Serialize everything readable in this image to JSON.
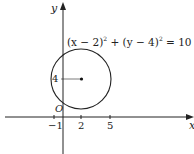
{
  "diagram": {
    "type": "coordinate-geometry-circle",
    "axes": {
      "x_label": "x",
      "y_label": "y",
      "origin_label": "O"
    },
    "equation": "(x − 2)² + (y − 4)² = 10",
    "equation_parts": {
      "a": "(x − 2)",
      "b": " + (y − 4)",
      "c": " = 10",
      "sup": "2"
    },
    "center": {
      "x": 2,
      "y": 4
    },
    "radius_squared": 10,
    "x_ticks": [
      "−1",
      "2",
      "5"
    ],
    "y_ticks": [
      "4"
    ],
    "colors": {
      "stroke": "#222222",
      "background": "#ffffff"
    }
  }
}
